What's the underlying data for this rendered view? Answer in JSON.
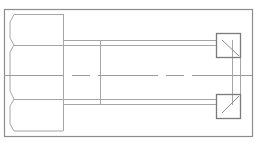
{
  "drawing": {
    "title": "Hex bolt side view",
    "colors": {
      "background": "#ffffff",
      "frame": "#8c8c8c",
      "outline": "#a6a6a6",
      "detail": "#8a8a8a",
      "centerline": "#9a9a9a"
    },
    "frame": {
      "x": 4,
      "y": 9,
      "width": 249,
      "height": 127
    },
    "head": {
      "left_top": [
        14,
        14
      ],
      "right_x": 63,
      "top_y": 14,
      "bottom_y": 131,
      "flat_lines_y": [
        45,
        99
      ],
      "notch_x": 14
    },
    "shank": {
      "x_start": 63,
      "x_end": 224,
      "top_lines_y": [
        40,
        45
      ],
      "bottom_lines_y": [
        99,
        104
      ],
      "section_line_x": 100
    },
    "centerline": {
      "y": 75,
      "x_start": 4,
      "x_end": 253
    },
    "thread_end_lines_x": [
      232,
      240
    ],
    "detail_boxes": [
      {
        "name": "upper",
        "x": 216,
        "y": 33,
        "size": 24
      },
      {
        "name": "lower",
        "x": 216,
        "y": 94,
        "size": 24
      }
    ]
  }
}
